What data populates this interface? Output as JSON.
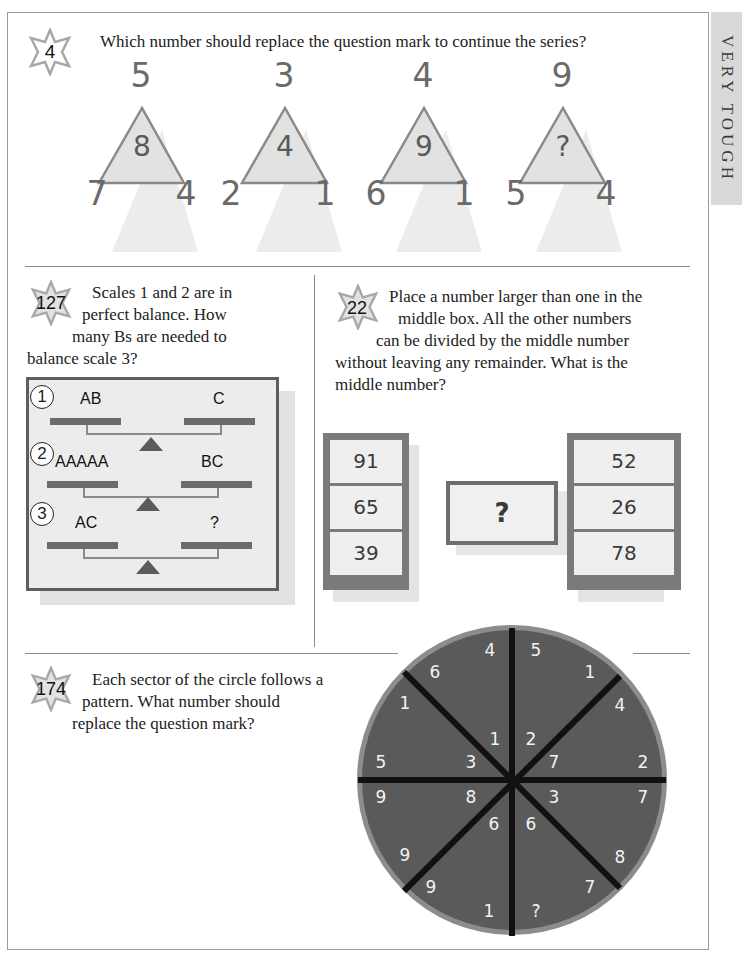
{
  "side_tab": {
    "label": "VERY TOUGH"
  },
  "puzzle_4": {
    "number": "4",
    "question": "Which number should replace the question mark to continue the series?",
    "triangles": [
      {
        "top": "5",
        "center": "8",
        "left": "7",
        "right": "4"
      },
      {
        "top": "3",
        "center": "4",
        "left": "2",
        "right": "1"
      },
      {
        "top": "4",
        "center": "9",
        "left": "6",
        "right": "1"
      },
      {
        "top": "9",
        "center": "?",
        "left": "5",
        "right": "4"
      }
    ]
  },
  "puzzle_127": {
    "number": "127",
    "question_lines": [
      "Scales 1 and 2 are in",
      "perfect balance. How",
      "many Bs are needed to",
      "balance scale 3?"
    ],
    "scales": [
      {
        "index": "1",
        "left": "AB",
        "right": "C"
      },
      {
        "index": "2",
        "left": "AAAAA",
        "right": "BC"
      },
      {
        "index": "3",
        "left": "AC",
        "right": "?"
      }
    ]
  },
  "puzzle_22": {
    "number": "22",
    "question_lines": [
      "Place a number larger than one in the",
      "middle box. All the other numbers",
      "can be divided by the middle number",
      "without leaving any remainder. What is the",
      "middle number?"
    ],
    "left_column": [
      "91",
      "65",
      "39"
    ],
    "middle": "?",
    "right_column": [
      "52",
      "26",
      "78"
    ]
  },
  "puzzle_174": {
    "number": "174",
    "question_lines": [
      "Each sector of the circle follows a",
      "pattern. What number should",
      "replace the question mark?"
    ],
    "wheel_numbers": [
      {
        "value": "4",
        "x": 490,
        "y": 650
      },
      {
        "value": "5",
        "x": 536,
        "y": 650
      },
      {
        "value": "6",
        "x": 435,
        "y": 672
      },
      {
        "value": "1",
        "x": 590,
        "y": 672
      },
      {
        "value": "1",
        "x": 405,
        "y": 703
      },
      {
        "value": "4",
        "x": 620,
        "y": 705
      },
      {
        "value": "1",
        "x": 495,
        "y": 739
      },
      {
        "value": "2",
        "x": 531,
        "y": 739
      },
      {
        "value": "5",
        "x": 381,
        "y": 762
      },
      {
        "value": "3",
        "x": 471,
        "y": 762
      },
      {
        "value": "7",
        "x": 554,
        "y": 762
      },
      {
        "value": "2",
        "x": 643,
        "y": 762
      },
      {
        "value": "9",
        "x": 381,
        "y": 797
      },
      {
        "value": "8",
        "x": 471,
        "y": 797
      },
      {
        "value": "3",
        "x": 554,
        "y": 797
      },
      {
        "value": "7",
        "x": 643,
        "y": 797
      },
      {
        "value": "6",
        "x": 494,
        "y": 824
      },
      {
        "value": "6",
        "x": 531,
        "y": 824
      },
      {
        "value": "9",
        "x": 405,
        "y": 855
      },
      {
        "value": "8",
        "x": 620,
        "y": 857
      },
      {
        "value": "9",
        "x": 431,
        "y": 887
      },
      {
        "value": "7",
        "x": 590,
        "y": 887
      },
      {
        "value": "1",
        "x": 489,
        "y": 911
      },
      {
        "value": "?",
        "x": 536,
        "y": 911
      }
    ]
  },
  "colors": {
    "frame": "#9a9a9a",
    "triangle_fill": "#e4e4e4",
    "triangle_stroke": "#8a8a8a",
    "wheel_fill": "#5a5a5a",
    "wheel_rim": "#8c8c8c",
    "wheel_spokes": "#111111"
  }
}
